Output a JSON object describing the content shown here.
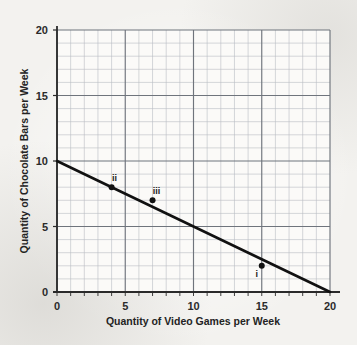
{
  "chart_data": {
    "type": "line",
    "title": "",
    "xlabel": "Quantity of Video Games per Week",
    "ylabel": "Quantity of Chocolate Bars per Week",
    "xlim": [
      0,
      20
    ],
    "ylim": [
      0,
      20
    ],
    "grid": true,
    "grid_minor_step": 1,
    "grid_major_step": 5,
    "legend": "none",
    "xticks": [
      "0",
      "5",
      "10",
      "15",
      "20"
    ],
    "xtick_values": [
      0,
      5,
      10,
      15,
      20
    ],
    "yticks": [
      "0",
      "5",
      "10",
      "15",
      "20"
    ],
    "ytick_values": [
      0,
      5,
      10,
      15,
      20
    ],
    "series": [
      {
        "name": "budget-line",
        "type": "line",
        "x": [
          0,
          20
        ],
        "y": [
          10,
          0
        ],
        "slope": -0.5,
        "intercept": 10,
        "color": "#111111",
        "width": 2.6
      }
    ],
    "points": [
      {
        "label": "i",
        "x": 15,
        "y": 2,
        "label_dx": -5,
        "label_dy": 11
      },
      {
        "label": "ii",
        "x": 4,
        "y": 8,
        "label_dx": 3,
        "label_dy": -6
      },
      {
        "label": "iii",
        "x": 7,
        "y": 7,
        "label_dx": 4,
        "label_dy": -6
      }
    ],
    "marker_color": "#111111",
    "marker_radius": 3
  },
  "axis": {
    "x_title": "Quantity of Video Games per Week",
    "y_title": "Quantity of Chocolate Bars per Week"
  },
  "ticks": {
    "x": [
      {
        "value": "0"
      },
      {
        "value": "5"
      },
      {
        "value": "10"
      },
      {
        "value": "15"
      },
      {
        "value": "20"
      }
    ],
    "y": [
      {
        "value": "0"
      },
      {
        "value": "5"
      },
      {
        "value": "10"
      },
      {
        "value": "15"
      },
      {
        "value": "20"
      }
    ]
  },
  "points": [
    {
      "label": "i"
    },
    {
      "label": "ii"
    },
    {
      "label": "iii"
    }
  ],
  "colors": {
    "line": "#111111",
    "grid_minor": "#b9bcc2",
    "grid_major": "#6f747c",
    "axis": "#2a2a2a",
    "background": "#f3f2ef"
  }
}
